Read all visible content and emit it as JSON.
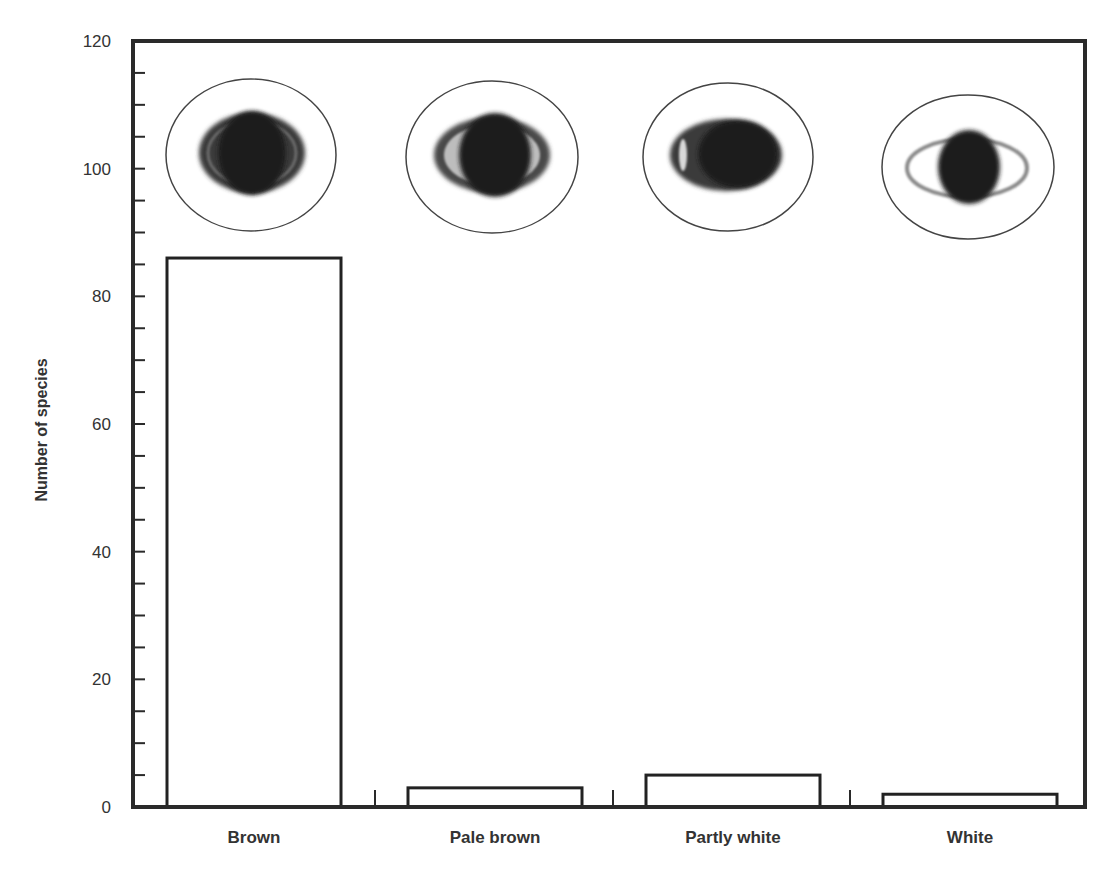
{
  "chart_data": {
    "type": "bar",
    "title": "",
    "xlabel": "",
    "ylabel": "Number of species",
    "categories": [
      "Brown",
      "Pale brown",
      "Partly white",
      "White"
    ],
    "values": [
      86,
      3,
      5,
      2
    ],
    "ylim": [
      0,
      120
    ],
    "yticks": [
      0,
      20,
      40,
      60,
      80,
      100,
      120
    ],
    "minor_tick_step": 5,
    "grid": false,
    "legend": "none",
    "bar_fill": "#ffffff",
    "bar_stroke": "#222222",
    "annotations": [
      {
        "category": "Brown",
        "icon": "eye-iris-brown-icon",
        "iris": "dark, fully pigmented"
      },
      {
        "category": "Pale brown",
        "icon": "eye-iris-pale-brown-icon",
        "iris": "pale brown ring"
      },
      {
        "category": "Partly white",
        "icon": "eye-iris-partly-white-icon",
        "iris": "partly white"
      },
      {
        "category": "White",
        "icon": "eye-iris-white-icon",
        "iris": "white iris, dark pupil"
      }
    ]
  }
}
